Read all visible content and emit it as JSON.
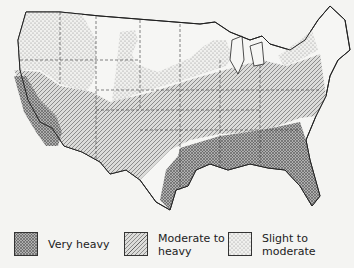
{
  "map": {
    "region": "Contiguous United States",
    "zones": [
      {
        "id": "very-heavy",
        "label": "Very heavy",
        "pattern": "crosshatch",
        "fill": "#9a9a9a"
      },
      {
        "id": "moderate-to-heavy",
        "label": "Moderate to heavy",
        "pattern": "diagonal-hatch",
        "fill": "#c8c8c8"
      },
      {
        "id": "slight-to-moderate",
        "label": "Slight to moderate",
        "pattern": "stipple",
        "fill": "#e2e2df"
      }
    ]
  },
  "legend": {
    "items": [
      {
        "line1": "Very heavy",
        "line2": ""
      },
      {
        "line1": "Moderate to",
        "line2": "heavy"
      },
      {
        "line1": "Slight to",
        "line2": "moderate"
      }
    ]
  }
}
